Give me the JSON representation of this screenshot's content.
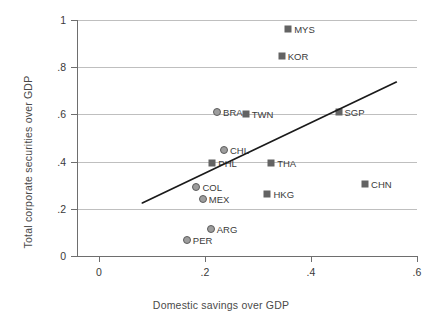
{
  "chart_data": {
    "type": "scatter",
    "title": "",
    "xlabel": "Domestic savings over GDP",
    "ylabel": "Total corporate securities over GDP",
    "xlim": [
      -0.0393,
      0.6
    ],
    "ylim": [
      0,
      1
    ],
    "xticks": [
      0,
      0.2,
      0.4,
      0.6
    ],
    "xtick_labels": [
      "0",
      ".2",
      ".4",
      ".6"
    ],
    "yticks": [
      0,
      0.2,
      0.4,
      0.6,
      0.8,
      1
    ],
    "ytick_labels": [
      "0",
      ".2",
      ".4",
      ".6",
      ".8",
      "1"
    ],
    "grid": "horizontal",
    "legend": "none",
    "points": [
      {
        "label": "MYS",
        "x": 0.357,
        "y": 0.96,
        "marker": "square",
        "label_pos": "right"
      },
      {
        "label": "KOR",
        "x": 0.345,
        "y": 0.847,
        "marker": "square",
        "label_pos": "right"
      },
      {
        "label": "SGP",
        "x": 0.452,
        "y": 0.61,
        "marker": "square",
        "label_pos": "right"
      },
      {
        "label": "BRA",
        "x": 0.223,
        "y": 0.61,
        "marker": "circle",
        "label_pos": "right"
      },
      {
        "label": "TWN",
        "x": 0.277,
        "y": 0.602,
        "marker": "square",
        "label_pos": "right"
      },
      {
        "label": "CHL",
        "x": 0.236,
        "y": 0.449,
        "marker": "circle",
        "label_pos": "right"
      },
      {
        "label": "PHL",
        "x": 0.214,
        "y": 0.394,
        "marker": "square",
        "label_pos": "right"
      },
      {
        "label": "THA",
        "x": 0.325,
        "y": 0.394,
        "marker": "square",
        "label_pos": "right"
      },
      {
        "label": "CHN",
        "x": 0.502,
        "y": 0.305,
        "marker": "square",
        "label_pos": "right"
      },
      {
        "label": "COL",
        "x": 0.184,
        "y": 0.292,
        "marker": "circle",
        "label_pos": "right"
      },
      {
        "label": "HKG",
        "x": 0.318,
        "y": 0.263,
        "marker": "square",
        "label_pos": "right"
      },
      {
        "label": "MEX",
        "x": 0.196,
        "y": 0.242,
        "marker": "circle",
        "label_pos": "right"
      },
      {
        "label": "ARG",
        "x": 0.211,
        "y": 0.114,
        "marker": "circle",
        "label_pos": "right"
      },
      {
        "label": "PER",
        "x": 0.166,
        "y": 0.068,
        "marker": "circle",
        "label_pos": "right"
      }
    ],
    "trendline": {
      "x0": 0.082,
      "y0": 0.225,
      "x1": 0.561,
      "y1": 0.737,
      "color": "#1a1a1a"
    }
  },
  "colors": {
    "square_marker": "#636363",
    "circle_fill": "#9d9d9d",
    "circle_edge": "#5d5d5d",
    "gridline": "#bfbfbf",
    "axis": "#6e6e6e",
    "text": "#3a3a3a",
    "trendline": "#1a1a1a"
  }
}
